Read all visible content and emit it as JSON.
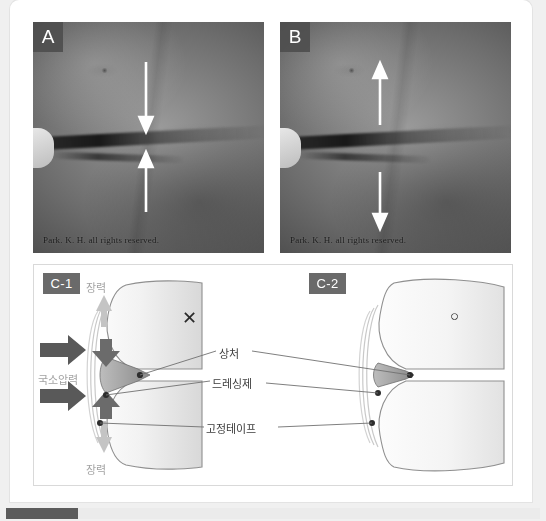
{
  "figure": {
    "panels": [
      {
        "id": "A",
        "letter": "A",
        "copyright": "Park. K. H. all rights reserved.",
        "arrow_mode": "converging",
        "description": "Clinical photograph of an abdominal wound with two white arrows pointing inward toward the wound"
      },
      {
        "id": "B",
        "letter": "B",
        "copyright": "Park. K. H. all rights reserved.",
        "arrow_mode": "diverging",
        "description": "Clinical photograph of an abdominal wound with two white arrows pointing outward away from the wound"
      }
    ]
  },
  "diagram": {
    "left": {
      "badge": "C-1",
      "verdict_mark": "✕",
      "tension_top_label": "장력",
      "tension_bottom_label": "장력",
      "local_pressure_label": "국소압력"
    },
    "right": {
      "badge": "C-2",
      "verdict_mark": "○"
    },
    "center_labels": [
      {
        "key": "wound",
        "text": "상처"
      },
      {
        "key": "dressing",
        "text": "드레싱제"
      },
      {
        "key": "tape",
        "text": "고정테이프"
      }
    ],
    "colors": {
      "badge_bg": "#6a6a6a",
      "pressure_arrow": "#595959",
      "tension_arrow": "#c4c4c4",
      "wound_fill": "#8d8d8d",
      "label_gray": "#a3a3a3",
      "label_dark": "#3b3b3b"
    }
  },
  "scrollbar": {
    "orientation": "horizontal",
    "thumb_position": "left"
  }
}
